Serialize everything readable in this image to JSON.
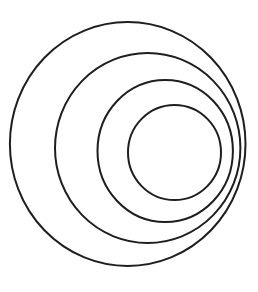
{
  "diagram": {
    "type": "nested-eccentric-circles",
    "stroke_color": "#1e1e1e",
    "background": "#ffffff",
    "circles": [
      {
        "name": "outer",
        "cx": 127.7,
        "cy": 144,
        "rx": 117.8,
        "ry": 122
      },
      {
        "name": "second",
        "cx": 147.7,
        "cy": 148,
        "rx": 92.7,
        "ry": 95
      },
      {
        "name": "third",
        "cx": 165.2,
        "cy": 151,
        "rx": 67.7,
        "ry": 71
      },
      {
        "name": "inner",
        "cx": 174.5,
        "cy": 152.5,
        "rx": 46.5,
        "ry": 47.5
      }
    ]
  }
}
